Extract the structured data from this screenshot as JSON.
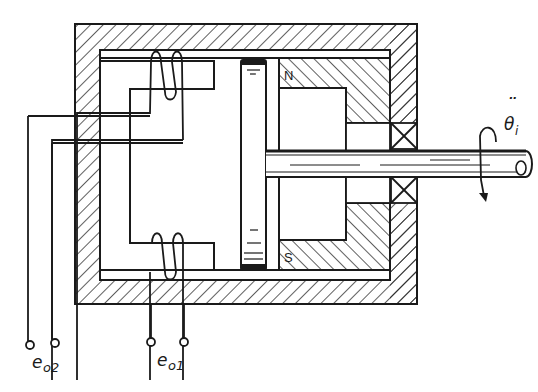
{
  "figure": {
    "labels": {
      "output1_main": "e",
      "output1_sub": "o1",
      "output2_main": "e",
      "output2_sub": "o2",
      "input_main": "θ",
      "input_sub": "i",
      "input_dots": "¨",
      "north_pole": "N",
      "south_pole": "S"
    },
    "colors": {
      "line": "#1a1a1a",
      "background": "#ffffff"
    },
    "components": [
      "housing",
      "upper-coil",
      "lower-coil",
      "c-core",
      "disc",
      "permanent-magnet",
      "shaft",
      "bearing-upper",
      "bearing-lower",
      "rotation-arrow"
    ]
  }
}
